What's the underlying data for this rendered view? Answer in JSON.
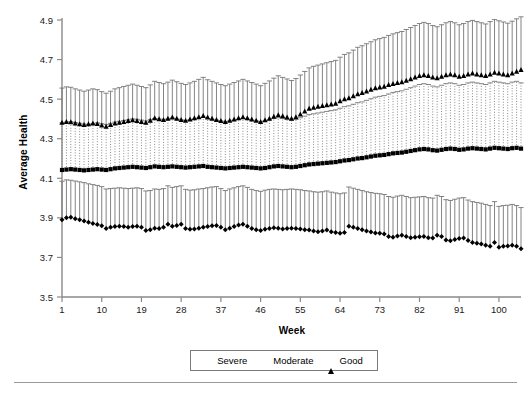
{
  "chart_data": {
    "type": "line",
    "title": "",
    "subtitle": "",
    "xlabel": "Week",
    "ylabel": "Average Health",
    "xlim": [
      1,
      105
    ],
    "ylim": [
      3.5,
      4.9
    ],
    "grid": false,
    "legend_position": "bottom-center",
    "error_bars": "vertical, upper whisker only, capped",
    "x_ticks": [
      1,
      10,
      19,
      28,
      37,
      46,
      55,
      64,
      73,
      82,
      91,
      100
    ],
    "x_tick_labels": [
      "1",
      "10",
      "19",
      "28",
      "37",
      "46",
      "55",
      "64",
      "73",
      "82",
      "91",
      "100"
    ],
    "y_ticks": [
      3.5,
      3.7,
      3.9,
      4.1,
      4.3,
      4.5,
      4.7,
      4.9
    ],
    "y_tick_labels": [
      "3.5",
      "3.7",
      "3.9",
      "4.1",
      "4.3",
      "4.5",
      "4.7",
      "4.9"
    ],
    "x": [
      1,
      2,
      3,
      4,
      5,
      6,
      7,
      8,
      9,
      10,
      11,
      12,
      13,
      14,
      15,
      16,
      17,
      18,
      19,
      20,
      21,
      22,
      23,
      24,
      25,
      26,
      27,
      28,
      29,
      30,
      31,
      32,
      33,
      34,
      35,
      36,
      37,
      38,
      39,
      40,
      41,
      42,
      43,
      44,
      45,
      46,
      47,
      48,
      49,
      50,
      51,
      52,
      53,
      54,
      55,
      56,
      57,
      58,
      59,
      60,
      61,
      62,
      63,
      64,
      65,
      66,
      67,
      68,
      69,
      70,
      71,
      72,
      73,
      74,
      75,
      76,
      77,
      78,
      79,
      80,
      81,
      82,
      83,
      84,
      85,
      86,
      87,
      88,
      89,
      90,
      91,
      92,
      93,
      94,
      95,
      96,
      97,
      98,
      99,
      100,
      101,
      102,
      103,
      104,
      105
    ],
    "series": [
      {
        "name": "Severe",
        "marker": "diamond",
        "error_bar_style": "solid",
        "values": [
          3.89,
          3.9,
          3.903,
          3.896,
          3.89,
          3.884,
          3.878,
          3.872,
          3.866,
          3.86,
          3.846,
          3.852,
          3.856,
          3.858,
          3.856,
          3.852,
          3.856,
          3.858,
          3.852,
          3.836,
          3.84,
          3.848,
          3.846,
          3.852,
          3.868,
          3.858,
          3.862,
          3.868,
          3.846,
          3.842,
          3.844,
          3.848,
          3.852,
          3.856,
          3.86,
          3.862,
          3.852,
          3.84,
          3.848,
          3.856,
          3.864,
          3.868,
          3.858,
          3.846,
          3.84,
          3.836,
          3.842,
          3.846,
          3.85,
          3.848,
          3.844,
          3.846,
          3.848,
          3.846,
          3.844,
          3.84,
          3.838,
          3.834,
          3.83,
          3.834,
          3.838,
          3.83,
          3.826,
          3.822,
          3.826,
          3.858,
          3.852,
          3.846,
          3.84,
          3.834,
          3.828,
          3.824,
          3.822,
          3.818,
          3.806,
          3.802,
          3.808,
          3.812,
          3.806,
          3.8,
          3.802,
          3.804,
          3.806,
          3.8,
          3.798,
          3.812,
          3.806,
          3.788,
          3.784,
          3.79,
          3.796,
          3.798,
          3.786,
          3.776,
          3.772,
          3.768,
          3.762,
          3.756,
          3.776,
          3.752,
          3.756,
          3.758,
          3.762,
          3.756,
          3.744
        ],
        "error_upper": [
          4.085,
          4.092,
          4.09,
          4.086,
          4.082,
          4.078,
          4.072,
          4.068,
          4.064,
          4.058,
          4.046,
          4.048,
          4.05,
          4.052,
          4.05,
          4.048,
          4.05,
          4.052,
          4.048,
          4.036,
          4.038,
          4.046,
          4.044,
          4.048,
          4.062,
          4.054,
          4.058,
          4.062,
          4.044,
          4.04,
          4.042,
          4.046,
          4.048,
          4.052,
          4.056,
          4.058,
          4.048,
          4.038,
          4.046,
          4.052,
          4.058,
          4.062,
          4.054,
          4.044,
          4.038,
          4.034,
          4.04,
          4.044,
          4.046,
          4.044,
          4.042,
          4.044,
          4.046,
          4.044,
          4.042,
          4.038,
          4.036,
          4.032,
          4.03,
          4.032,
          4.036,
          4.03,
          4.026,
          4.022,
          4.026,
          4.056,
          4.05,
          4.044,
          4.038,
          4.032,
          4.028,
          4.024,
          4.022,
          4.018,
          4.008,
          4.004,
          4.01,
          4.014,
          4.008,
          4.002,
          4.004,
          4.006,
          4.008,
          4.002,
          4.0,
          4.014,
          4.008,
          3.992,
          3.988,
          3.994,
          4.0,
          4.002,
          3.99,
          3.982,
          3.978,
          3.974,
          3.968,
          3.962,
          3.982,
          3.958,
          3.962,
          3.964,
          3.968,
          3.962,
          3.952
        ]
      },
      {
        "name": "Moderate",
        "marker": "square",
        "error_bar_style": "dotted",
        "values": [
          4.142,
          4.144,
          4.146,
          4.144,
          4.142,
          4.14,
          4.142,
          4.144,
          4.146,
          4.144,
          4.142,
          4.146,
          4.15,
          4.152,
          4.154,
          4.156,
          4.158,
          4.156,
          4.154,
          4.152,
          4.156,
          4.16,
          4.158,
          4.156,
          4.158,
          4.16,
          4.158,
          4.156,
          4.154,
          4.156,
          4.158,
          4.16,
          4.162,
          4.158,
          4.156,
          4.154,
          4.152,
          4.15,
          4.152,
          4.154,
          4.156,
          4.158,
          4.156,
          4.154,
          4.152,
          4.15,
          4.152,
          4.156,
          4.16,
          4.162,
          4.16,
          4.158,
          4.156,
          4.158,
          4.162,
          4.166,
          4.17,
          4.172,
          4.174,
          4.176,
          4.178,
          4.18,
          4.182,
          4.186,
          4.19,
          4.192,
          4.196,
          4.2,
          4.202,
          4.206,
          4.21,
          4.214,
          4.216,
          4.218,
          4.222,
          4.226,
          4.228,
          4.23,
          4.234,
          4.238,
          4.242,
          4.246,
          4.248,
          4.246,
          4.242,
          4.24,
          4.244,
          4.248,
          4.25,
          4.248,
          4.244,
          4.246,
          4.25,
          4.252,
          4.25,
          4.248,
          4.246,
          4.25,
          4.254,
          4.252,
          4.25,
          4.248,
          4.252,
          4.254,
          4.25
        ],
        "error_upper": [
          4.38,
          4.384,
          4.386,
          4.382,
          4.378,
          4.374,
          4.372,
          4.376,
          4.38,
          4.376,
          4.372,
          4.378,
          4.384,
          4.388,
          4.392,
          4.396,
          4.4,
          4.398,
          4.394,
          4.39,
          4.396,
          4.402,
          4.4,
          4.396,
          4.4,
          4.404,
          4.4,
          4.396,
          4.392,
          4.396,
          4.4,
          4.404,
          4.408,
          4.402,
          4.398,
          4.394,
          4.39,
          4.386,
          4.39,
          4.394,
          4.398,
          4.402,
          4.398,
          4.394,
          4.39,
          4.386,
          4.39,
          4.396,
          4.402,
          4.406,
          4.402,
          4.398,
          4.394,
          4.398,
          4.406,
          4.414,
          4.422,
          4.426,
          4.43,
          4.434,
          4.438,
          4.442,
          4.446,
          4.454,
          4.462,
          4.466,
          4.474,
          4.482,
          4.486,
          4.494,
          4.502,
          4.51,
          4.514,
          4.518,
          4.526,
          4.534,
          4.538,
          4.542,
          4.55,
          4.558,
          4.566,
          4.574,
          4.578,
          4.574,
          4.566,
          4.562,
          4.57,
          4.578,
          4.582,
          4.578,
          4.57,
          4.574,
          4.582,
          4.586,
          4.582,
          4.578,
          4.574,
          4.582,
          4.59,
          4.586,
          4.582,
          4.578,
          4.586,
          4.59,
          4.582
        ]
      },
      {
        "name": "Good",
        "marker": "triangle",
        "error_bar_style": "solid",
        "values": [
          4.382,
          4.386,
          4.384,
          4.378,
          4.374,
          4.37,
          4.374,
          4.378,
          4.376,
          4.368,
          4.362,
          4.37,
          4.378,
          4.382,
          4.386,
          4.39,
          4.394,
          4.39,
          4.386,
          4.382,
          4.392,
          4.404,
          4.4,
          4.396,
          4.402,
          4.408,
          4.402,
          4.396,
          4.392,
          4.398,
          4.404,
          4.41,
          4.416,
          4.408,
          4.402,
          4.396,
          4.39,
          4.386,
          4.392,
          4.398,
          4.404,
          4.41,
          4.404,
          4.398,
          4.392,
          4.386,
          4.394,
          4.402,
          4.412,
          4.42,
          4.414,
          4.408,
          4.402,
          4.41,
          4.424,
          4.438,
          4.452,
          4.458,
          4.462,
          4.466,
          4.47,
          4.474,
          4.478,
          4.49,
          4.5,
          4.506,
          4.516,
          4.526,
          4.532,
          4.54,
          4.548,
          4.556,
          4.56,
          4.564,
          4.572,
          4.578,
          4.582,
          4.586,
          4.594,
          4.602,
          4.61,
          4.618,
          4.622,
          4.618,
          4.61,
          4.606,
          4.614,
          4.622,
          4.626,
          4.622,
          4.614,
          4.618,
          4.626,
          4.63,
          4.626,
          4.622,
          4.618,
          4.626,
          4.634,
          4.63,
          4.626,
          4.622,
          4.63,
          4.64,
          4.648
        ],
        "error_upper": [
          4.556,
          4.562,
          4.56,
          4.552,
          4.546,
          4.54,
          4.546,
          4.552,
          4.548,
          4.538,
          4.53,
          4.54,
          4.552,
          4.558,
          4.564,
          4.57,
          4.576,
          4.57,
          4.564,
          4.558,
          4.572,
          4.59,
          4.584,
          4.578,
          4.586,
          4.596,
          4.588,
          4.58,
          4.574,
          4.582,
          4.59,
          4.6,
          4.61,
          4.598,
          4.59,
          4.582,
          4.574,
          4.568,
          4.576,
          4.584,
          4.592,
          4.6,
          4.592,
          4.584,
          4.576,
          4.568,
          4.58,
          4.592,
          4.606,
          4.618,
          4.61,
          4.602,
          4.594,
          4.604,
          4.622,
          4.64,
          4.658,
          4.666,
          4.672,
          4.678,
          4.684,
          4.69,
          4.696,
          4.712,
          4.726,
          4.734,
          4.748,
          4.762,
          4.77,
          4.78,
          4.79,
          4.8,
          4.806,
          4.812,
          4.822,
          4.83,
          4.836,
          4.842,
          4.852,
          4.862,
          4.872,
          4.882,
          4.888,
          4.882,
          4.872,
          4.866,
          4.876,
          4.886,
          4.892,
          4.886,
          4.876,
          4.882,
          4.892,
          4.898,
          4.892,
          4.886,
          4.88,
          4.892,
          4.902,
          4.896,
          4.89,
          4.884,
          4.894,
          4.906,
          4.916
        ]
      }
    ]
  },
  "legend": {
    "items": [
      {
        "label": "Severe",
        "marker": "diamond"
      },
      {
        "label": "Moderate",
        "marker": "square"
      },
      {
        "label": "Good",
        "marker": "triangle"
      }
    ]
  },
  "colors": {
    "marker": "#000000",
    "error_bar": "#6e6e6e",
    "axis": "#8a8a8a",
    "text": "#000000",
    "legend_border": "#7a7a7a",
    "rule": "#9a9a9a"
  }
}
